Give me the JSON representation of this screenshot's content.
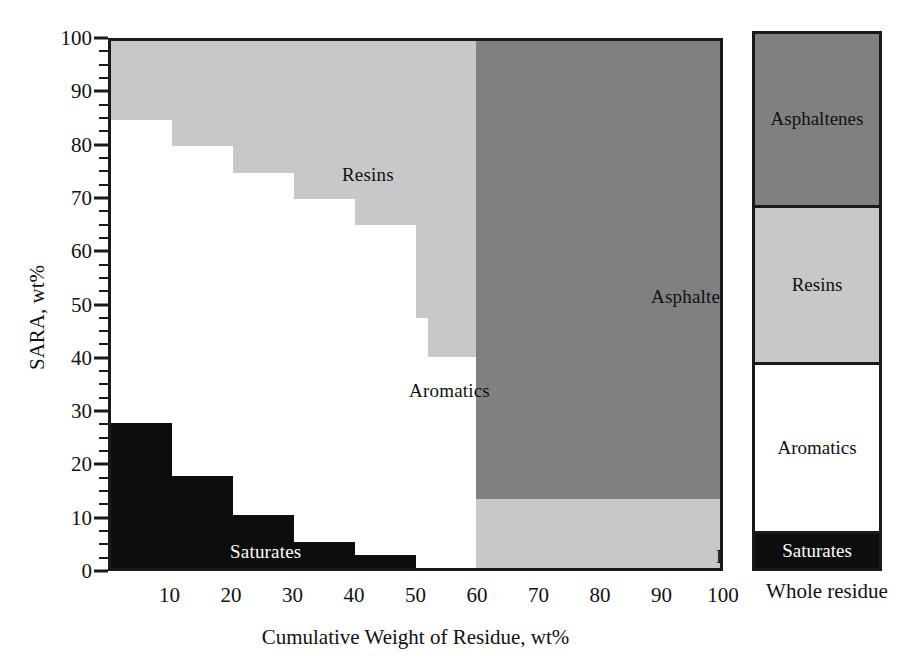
{
  "chart_data": {
    "type": "area",
    "title": "",
    "xlabel": "Cumulative Weight of Residue, wt%",
    "ylabel": "SARA, wt%",
    "xlim": [
      0,
      100
    ],
    "ylim": [
      0,
      100
    ],
    "grid": false,
    "legend_position": "in-plot annotations",
    "x_ticks": [
      10,
      20,
      30,
      40,
      50,
      60,
      70,
      80,
      90,
      100
    ],
    "y_ticks": [
      0,
      10,
      20,
      30,
      40,
      50,
      60,
      70,
      80,
      90,
      100
    ],
    "y_minor_tick_step": 2.5,
    "annotations": [
      {
        "text": "Resins",
        "x": 30,
        "y": 83
      },
      {
        "text": "Aromatics",
        "x": 42,
        "y": 43
      },
      {
        "text": "Asphaltenes",
        "x": 80,
        "y": 60
      },
      {
        "text": "Resins",
        "x": 90,
        "y": 9
      },
      {
        "text": "Saturates",
        "x": 9,
        "y": 14
      }
    ],
    "series": [
      {
        "name": "Saturates",
        "color": "#0d0d0d",
        "bins": [
          {
            "x_start": 0,
            "x_end": 10,
            "value": 27.5
          },
          {
            "x_start": 10,
            "x_end": 20,
            "value": 17.5
          },
          {
            "x_start": 20,
            "x_end": 30,
            "value": 10.0
          },
          {
            "x_start": 30,
            "x_end": 40,
            "value": 5.0
          },
          {
            "x_start": 40,
            "x_end": 50,
            "value": 2.5
          },
          {
            "x_start": 50,
            "x_end": 100,
            "value": 0.0
          }
        ]
      },
      {
        "name": "Aromatics",
        "color": "#ffffff",
        "bins": [
          {
            "x_start": 0,
            "x_end": 10,
            "value": 57.5
          },
          {
            "x_start": 10,
            "x_end": 20,
            "value": 62.5
          },
          {
            "x_start": 20,
            "x_end": 30,
            "value": 65.0
          },
          {
            "x_start": 30,
            "x_end": 40,
            "value": 65.0
          },
          {
            "x_start": 40,
            "x_end": 50,
            "value": 62.5
          },
          {
            "x_start": 50,
            "x_end": 60,
            "value": 40.0
          },
          {
            "x_start": 60,
            "x_end": 100,
            "value": 0.0
          }
        ]
      },
      {
        "name": "Resins",
        "color": "#c8c8c8",
        "bins": [
          {
            "x_start": 0,
            "x_end": 10,
            "value": 15.0
          },
          {
            "x_start": 10,
            "x_end": 20,
            "value": 20.0
          },
          {
            "x_start": 20,
            "x_end": 30,
            "value": 25.0
          },
          {
            "x_start": 30,
            "x_end": 40,
            "value": 30.0
          },
          {
            "x_start": 40,
            "x_end": 50,
            "value": 35.0
          },
          {
            "x_start": 50,
            "x_end": 60,
            "value": 60.0
          },
          {
            "x_start": 60,
            "x_end": 100,
            "value": 13.0
          }
        ]
      },
      {
        "name": "Asphaltenes",
        "color": "#808080",
        "bins": [
          {
            "x_start": 0,
            "x_end": 60,
            "value": 0.0
          },
          {
            "x_start": 60,
            "x_end": 100,
            "value": 87.0
          }
        ]
      }
    ],
    "cumulative_boundaries": {
      "note": "Stacked cumulative tops read off the plot, in wt%",
      "saturates_top": [
        27.5,
        17.5,
        10.0,
        5.0,
        2.5,
        0.0,
        0.0,
        0.0,
        0.0,
        0.0
      ],
      "aromatics_top": [
        85.0,
        80.0,
        75.0,
        70.0,
        65.0,
        40.0,
        0.0,
        0.0,
        0.0,
        0.0
      ],
      "resins_top": [
        100.0,
        100.0,
        100.0,
        100.0,
        100.0,
        100.0,
        13.0,
        13.0,
        13.0,
        13.0
      ],
      "asphaltenes_top": [
        100.0,
        100.0,
        100.0,
        100.0,
        100.0,
        100.0,
        100.0,
        100.0,
        100.0,
        100.0
      ],
      "resins_steps_detail": [
        {
          "x_start": 0,
          "x_end": 10,
          "top": 100,
          "bottom": 85.0
        },
        {
          "x_start": 10,
          "x_end": 15,
          "top": 100,
          "bottom": 80.0
        },
        {
          "x_start": 15,
          "x_end": 22,
          "top": 100,
          "bottom": 75.0
        },
        {
          "x_start": 22,
          "x_end": 30,
          "top": 100,
          "bottom": 70.0
        },
        {
          "x_start": 30,
          "x_end": 37,
          "top": 100,
          "bottom": 65.0
        },
        {
          "x_start": 37,
          "x_end": 45,
          "top": 100,
          "bottom": 55.0
        },
        {
          "x_start": 45,
          "x_end": 52,
          "top": 100,
          "bottom": 47.5
        },
        {
          "x_start": 52,
          "x_end": 60,
          "top": 100,
          "bottom": 40.0
        }
      ]
    }
  },
  "axes": {
    "y_title": "SARA, wt%",
    "x_title": "Cumulative Weight of Residue, wt%",
    "y_tick_labels": [
      "0",
      "10",
      "20",
      "30",
      "40",
      "50",
      "60",
      "70",
      "80",
      "90",
      "100"
    ],
    "x_tick_labels": [
      "10",
      "20",
      "30",
      "40",
      "50",
      "60",
      "70",
      "80",
      "90",
      "100"
    ]
  },
  "plot_labels": {
    "resins_main": "Resins",
    "aromatics_main": "Aromatics",
    "asphaltenes_main": "Asphaltenes",
    "resins_band": "Resins",
    "saturates_main": "Saturates"
  },
  "side_bar": {
    "caption": "Whole residue",
    "segments": [
      {
        "label": "Asphaltenes",
        "color": "#808080",
        "height_pct": 32.0
      },
      {
        "label": "Resins",
        "color": "#c8c8c8",
        "height_pct": 29.5
      },
      {
        "label": "Aromatics",
        "color": "#ffffff",
        "height_pct": 31.5
      },
      {
        "label": "Saturates",
        "color": "#0d0d0d",
        "height_pct": 7.0
      }
    ]
  },
  "colors": {
    "saturates": "#0d0d0d",
    "aromatics": "#ffffff",
    "resins": "#c8c8c8",
    "asphaltenes": "#808080",
    "frame": "#1a1a1a",
    "text": "#111111"
  }
}
